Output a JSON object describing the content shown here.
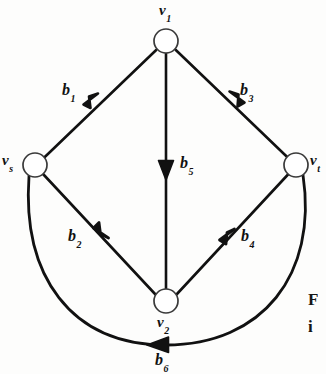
{
  "figure": {
    "type": "directed-graph",
    "background_color": "#fdfdfc",
    "stroke_color": "#111111",
    "node_fill": "#ffffff",
    "nodes": [
      {
        "id": "v1",
        "base": "v",
        "sub": "1",
        "label": "v₁",
        "cx": 166,
        "cy": 41,
        "r": 12,
        "label_x": 159,
        "label_y": 2
      },
      {
        "id": "vs",
        "base": "v",
        "sub": "s",
        "label": "vₛ",
        "cx": 35,
        "cy": 165,
        "r": 12,
        "label_x": 2,
        "label_y": 152
      },
      {
        "id": "vt",
        "base": "v",
        "sub": "t",
        "label": "vₜ",
        "cx": 296,
        "cy": 165,
        "r": 12,
        "label_x": 310,
        "label_y": 152
      },
      {
        "id": "v2",
        "base": "v",
        "sub": "2",
        "label": "v₂",
        "cx": 166,
        "cy": 301,
        "r": 12,
        "label_x": 157,
        "label_y": 314
      }
    ],
    "edges": [
      {
        "id": "b1",
        "base": "b",
        "sub": "1",
        "label": "b₁",
        "from": "vs",
        "to": "v1",
        "shape": "line",
        "label_x": 62,
        "label_y": 82
      },
      {
        "id": "b2",
        "base": "b",
        "sub": "2",
        "label": "b₂",
        "from": "vs",
        "to": "v2",
        "shape": "line",
        "label_x": 68,
        "label_y": 228
      },
      {
        "id": "b3",
        "base": "b",
        "sub": "3",
        "label": "b₃",
        "from": "vt",
        "to": "v1",
        "shape": "line",
        "label_x": 240,
        "label_y": 82
      },
      {
        "id": "b4",
        "base": "b",
        "sub": "4",
        "label": "b₄",
        "from": "v2",
        "to": "vt",
        "shape": "line",
        "label_x": 241,
        "label_y": 228
      },
      {
        "id": "b5",
        "base": "b",
        "sub": "5",
        "label": "b₅",
        "from": "v1",
        "to": "v2",
        "shape": "line",
        "label_x": 180,
        "label_y": 155
      },
      {
        "id": "b6",
        "base": "b",
        "sub": "6",
        "label": "b₆",
        "from": "vt",
        "to": "vs",
        "shape": "curve",
        "label_x": 155,
        "label_y": 352
      }
    ],
    "caption_fragments": [
      {
        "id": "frag-1",
        "text": "F",
        "x": 308,
        "y": 290
      },
      {
        "id": "frag-2",
        "text": "i",
        "x": 308,
        "y": 317
      }
    ]
  }
}
